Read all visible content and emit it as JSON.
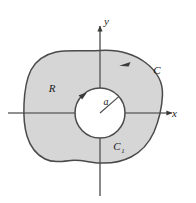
{
  "figure": {
    "type": "math-diagram",
    "background_color": "#ffffff"
  },
  "axes": {
    "x_label": "x",
    "y_label": "y",
    "axis_color": "#5a5a5a",
    "origin": {
      "x": 100,
      "y": 113
    },
    "x_axis": {
      "x1": 8,
      "y1": 113,
      "x2": 178,
      "y2": 113
    },
    "y_axis": {
      "x1": 100,
      "y1": 195,
      "x2": 100,
      "y2": 20
    }
  },
  "region": {
    "label": "R",
    "label_position": {
      "x": 52,
      "y": 88
    },
    "fill_color": "#d6d6d6",
    "stroke_color": "#4a4a4a"
  },
  "outer_curve": {
    "label": "C",
    "label_position": {
      "x": 157,
      "y": 71
    },
    "orientation": "counterclockwise",
    "arrow_position": {
      "x": 124,
      "y": 64
    }
  },
  "inner_curve": {
    "label": "C",
    "subscript": "1",
    "label_position": {
      "x": 120,
      "y": 146
    },
    "orientation": "clockwise",
    "fill_color": "#ffffff",
    "center": {
      "x": 100,
      "y": 113
    },
    "radius": 25
  },
  "radius": {
    "label": "a",
    "label_position": {
      "x": 104,
      "y": 104
    },
    "line": {
      "x1": 100,
      "y1": 113,
      "x2": 119,
      "y2": 97
    }
  }
}
